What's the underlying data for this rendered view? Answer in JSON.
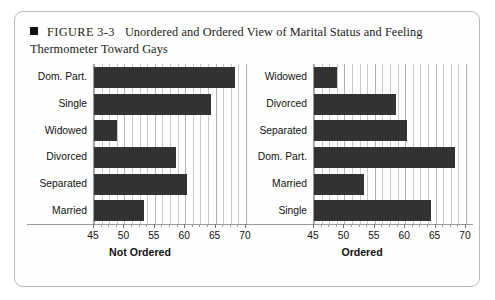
{
  "figure": {
    "bullet_icon": "black-square-bullet",
    "number": "FIGURE 3-3",
    "caption": "Unordered and Ordered View of Marital Status and Feeling Thermometer Toward Gays"
  },
  "style": {
    "bar_color": "#333333",
    "grid_color": "#c9c9c9",
    "border_color": "#b9b9b9",
    "background": "#ffffff"
  },
  "chart_data": [
    {
      "type": "bar",
      "orientation": "horizontal",
      "panel": "left",
      "title": "",
      "xlabel": "Not Ordered",
      "ylabel": "",
      "xlim": [
        45,
        70
      ],
      "xticks": [
        45,
        50,
        55,
        60,
        65,
        70
      ],
      "xticklabels": [
        "45",
        "50",
        "55",
        "60",
        "65",
        "70"
      ],
      "grid": true,
      "legend": false,
      "categories": [
        "Dom. Part.",
        "Single",
        "Widowed",
        "Divorced",
        "Separated",
        "Married"
      ],
      "values": [
        68.2,
        64.2,
        48.8,
        58.5,
        60.3,
        53.3
      ]
    },
    {
      "type": "bar",
      "orientation": "horizontal",
      "panel": "right",
      "title": "",
      "xlabel": "Ordered",
      "ylabel": "",
      "xlim": [
        45,
        70
      ],
      "xticks": [
        45,
        50,
        55,
        60,
        65,
        70
      ],
      "xticklabels": [
        "45",
        "50",
        "55",
        "60",
        "65",
        "70"
      ],
      "grid": true,
      "legend": false,
      "categories": [
        "Widowed",
        "Divorced",
        "Separated",
        "Dom. Part.",
        "Married",
        "Single"
      ],
      "values": [
        48.8,
        58.5,
        60.3,
        68.2,
        53.3,
        64.2
      ]
    }
  ]
}
